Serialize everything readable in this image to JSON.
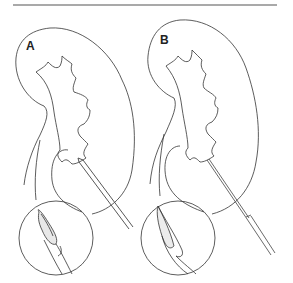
{
  "figure": {
    "panels": [
      {
        "label": "A",
        "description": "Kidney with needle; inset shows bevelled needle tip with sheath"
      },
      {
        "label": "B",
        "description": "Kidney with fine needle; inset shows needle tip with longer sheath"
      }
    ],
    "colors": {
      "stroke": "#333333",
      "rule": "#555555",
      "background": "#ffffff"
    }
  }
}
